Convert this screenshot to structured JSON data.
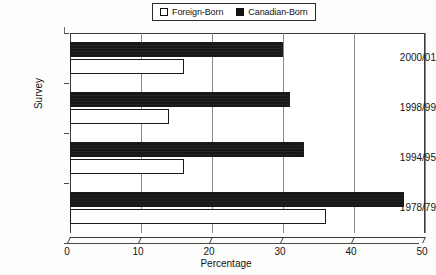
{
  "legend": {
    "entries": [
      {
        "label": "Foreign-Born",
        "swatch": "open-square-icon",
        "color": "#ffffff"
      },
      {
        "label": "Canadian-Born",
        "swatch": "filled-square-icon",
        "color": "#111111"
      }
    ]
  },
  "axes": {
    "x_title": "Percentage",
    "y_title": "Survey",
    "x_ticks": [
      "0",
      "10",
      "20",
      "30",
      "40",
      "50"
    ]
  },
  "chart_data": {
    "type": "bar",
    "orientation": "horizontal",
    "title": "",
    "subtitle": "",
    "xlabel": "Percentage",
    "ylabel": "Survey",
    "xlim": [
      0,
      50
    ],
    "xticks": [
      0,
      10,
      20,
      30,
      40,
      50
    ],
    "grid": true,
    "grid_axis": "x",
    "legend_position": "top-center",
    "categories": [
      "2000/01",
      "1998/99",
      "1994/95",
      "1978/79"
    ],
    "series": [
      {
        "name": "Foreign-Born",
        "color": "#ffffff",
        "values": [
          16,
          14,
          16,
          36
        ]
      },
      {
        "name": "Canadian-Born",
        "color": "#111111",
        "values": [
          30,
          31,
          33,
          47
        ]
      }
    ]
  }
}
